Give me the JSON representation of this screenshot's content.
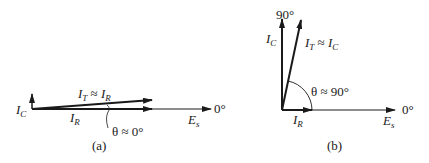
{
  "figure": {
    "panel_a": {
      "caption": "(a)",
      "labels": {
        "ic": {
          "main": "I",
          "sub": "C"
        },
        "it": {
          "main": "I",
          "sub": "T",
          "approx": " ≈ ",
          "main2": "I",
          "sub2": "R"
        },
        "ir": {
          "main": "I",
          "sub": "R"
        },
        "es": {
          "main": "E",
          "sub": "s"
        },
        "zero_deg": "0°",
        "theta": "θ ≈ 0°"
      }
    },
    "panel_b": {
      "caption": "(b)",
      "labels": {
        "ninety_deg": "90°",
        "ic": {
          "main": "I",
          "sub": "C"
        },
        "it": {
          "main": "I",
          "sub": "T",
          "approx": " ≈ ",
          "main2": "I",
          "sub2": "C"
        },
        "ir": {
          "main": "I",
          "sub": "R"
        },
        "es": {
          "main": "E",
          "sub": "s"
        },
        "zero_deg": "0°",
        "theta": "θ ≈ 90°"
      }
    },
    "colors": {
      "ink": "#1a1a1a",
      "background": "#ffffff"
    }
  }
}
